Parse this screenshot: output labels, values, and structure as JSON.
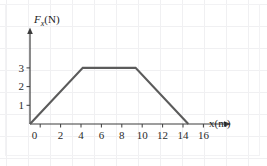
{
  "chart_data": {
    "type": "line",
    "title": "",
    "subtitle": "",
    "xlabel": "x(m)",
    "ylabel": "F_x(N)",
    "ylabel_main": "F",
    "ylabel_sub": "x",
    "ylabel_unit": "(N)",
    "xlim": [
      0,
      17
    ],
    "ylim": [
      0,
      3.8
    ],
    "grid": "faint-background-grid",
    "legend": "none",
    "x_ticks": [
      0,
      2,
      4,
      6,
      8,
      10,
      12,
      14,
      16
    ],
    "x_tick_labels": [
      "0",
      "2",
      "4",
      "6",
      "8",
      "10",
      "12",
      "14",
      "16"
    ],
    "y_ticks": [
      0,
      1,
      2,
      3
    ],
    "y_tick_labels": [
      "0",
      "1",
      "2",
      "3"
    ],
    "series": [
      {
        "name": "Force vs position",
        "color": "#5b5b5b",
        "x": [
          0,
          5,
          10,
          15
        ],
        "values": [
          0,
          3,
          3,
          0
        ]
      }
    ],
    "annotations": []
  },
  "axes": {
    "x_axis_name": "x-axis",
    "y_axis_name": "y-axis",
    "axis_color": "#3c3c3c",
    "line_color": "#5b5b5b",
    "grid_color": "#f0f0f2"
  }
}
